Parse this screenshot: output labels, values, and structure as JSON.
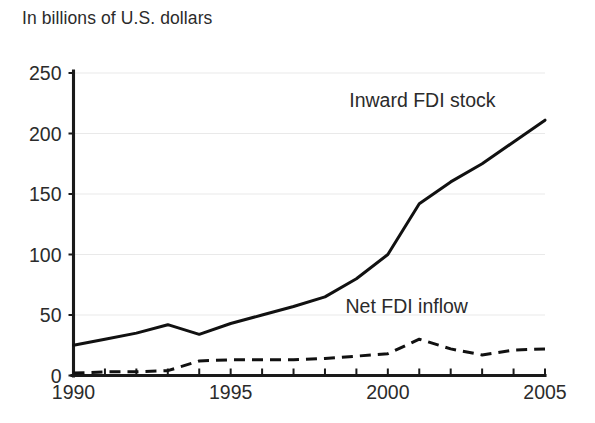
{
  "chart_data": {
    "type": "line",
    "title": "In billions of U.S. dollars",
    "xlabel": "",
    "ylabel": "",
    "xlim": [
      1990,
      2005
    ],
    "ylim": [
      0,
      250
    ],
    "yticks": [
      0,
      50,
      100,
      150,
      200,
      250
    ],
    "ytick_labels": [
      "0",
      "50",
      "100",
      "150",
      "200",
      "250"
    ],
    "xticks": [
      1990,
      1991,
      1992,
      1993,
      1994,
      1995,
      1996,
      1997,
      1998,
      1999,
      2000,
      2001,
      2002,
      2003,
      2004,
      2005
    ],
    "xtick_labels_shown": [
      "1990",
      "1995",
      "2000",
      "2005"
    ],
    "x": [
      1990,
      1991,
      1992,
      1993,
      1994,
      1995,
      1996,
      1997,
      1998,
      1999,
      2000,
      2001,
      2002,
      2003,
      2004,
      2005
    ],
    "grid": true,
    "grid_axis": "y",
    "legend_position": "inline-annotations",
    "series": [
      {
        "name": "Inward FDI stock",
        "style": "solid",
        "color": "#111111",
        "label_x": 2001.1,
        "label_y": 222,
        "values": [
          25,
          30,
          35,
          42,
          34,
          43,
          50,
          57,
          65,
          80,
          100,
          142,
          160,
          175,
          193,
          211
        ]
      },
      {
        "name": "Net FDI inflow",
        "style": "dashed",
        "color": "#111111",
        "label_x": 2000.6,
        "label_y": 52,
        "values": [
          2,
          3,
          3,
          4,
          12,
          13,
          13,
          13,
          14,
          16,
          18,
          30,
          22,
          17,
          21,
          22
        ]
      }
    ]
  },
  "axis": {
    "y_labels": [
      "250",
      "200",
      "150",
      "100",
      "50",
      "0"
    ],
    "x_labels": [
      "1990",
      "1995",
      "2000",
      "2005"
    ]
  },
  "annotations": {
    "inward_label": "Inward FDI stock",
    "inflow_label": "Net FDI inflow"
  }
}
